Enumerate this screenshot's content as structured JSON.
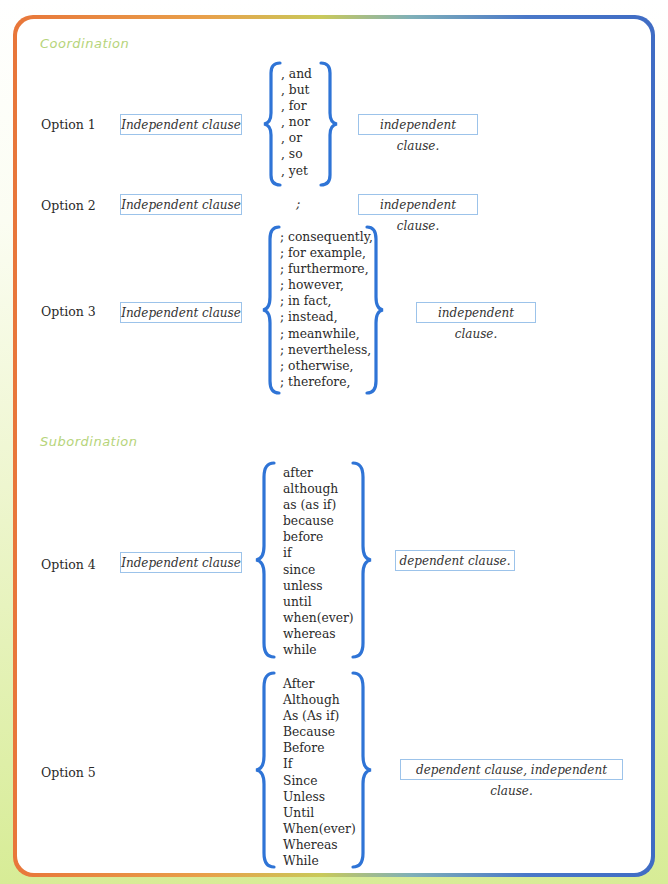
{
  "colors": {
    "brace": "#2f74d6",
    "box_border": "#9cc3ea",
    "section_title": "#b6d47a",
    "frame_left": "#e8763a",
    "frame_right": "#3f6cc4"
  },
  "sections": {
    "coordination": {
      "title": "Coordination"
    },
    "subordination": {
      "title": "Subordination"
    }
  },
  "options": [
    {
      "label": "Option 1",
      "left_clause": "Independent clause",
      "connectors": [
        ", and",
        ", but",
        ", for",
        ", nor",
        ", or",
        ", so",
        ", yet"
      ],
      "right_clause": "independent clause."
    },
    {
      "label": "Option 2",
      "left_clause": "Independent clause",
      "connector": ";",
      "right_clause": "independent clause."
    },
    {
      "label": "Option 3",
      "left_clause": "Independent clause",
      "connectors": [
        "; consequently,",
        "; for example,",
        "; furthermore,",
        "; however,",
        "; in fact,",
        "; instead,",
        "; meanwhile,",
        "; nevertheless,",
        "; otherwise,",
        "; therefore,"
      ],
      "right_clause": "independent clause."
    },
    {
      "label": "Option 4",
      "left_clause": "Independent clause",
      "connectors": [
        "after",
        "although",
        "as (as if)",
        "because",
        "before",
        "if",
        "since",
        "unless",
        "until",
        "when(ever)",
        "whereas",
        "while"
      ],
      "right_clause": "dependent clause."
    },
    {
      "label": "Option 5",
      "connectors": [
        "After",
        "Although",
        "As (As if)",
        "Because",
        "Before",
        "If",
        "Since",
        "Unless",
        "Until",
        "When(ever)",
        "Whereas",
        "While"
      ],
      "right_clause": "dependent clause, independent clause."
    }
  ]
}
